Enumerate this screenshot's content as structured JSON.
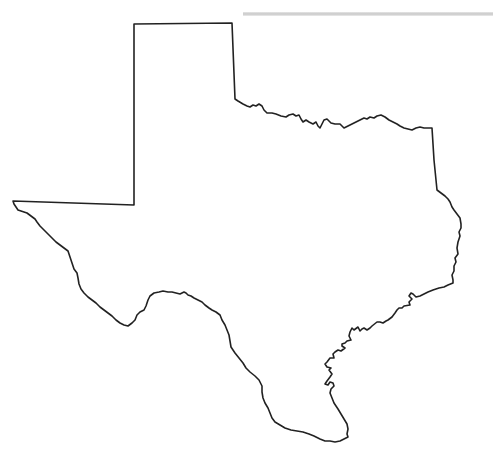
{
  "map": {
    "subject": "Texas state outline",
    "style": "black outline on white",
    "colors": {
      "background": "#ffffff",
      "stroke": "#222222",
      "shadow": "#c8c8c8"
    },
    "features": [
      "panhandle",
      "red-river-border",
      "east-border",
      "gulf-coast",
      "rio-grande-border"
    ]
  }
}
